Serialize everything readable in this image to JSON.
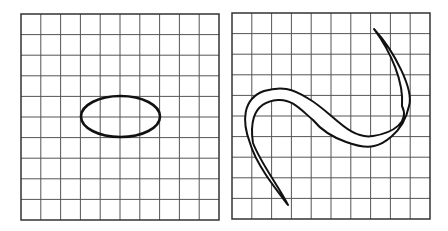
{
  "diagram": {
    "panels": [
      {
        "name": "ellipse-panel",
        "grid": {
          "x": 21,
          "y": 14,
          "width": 198,
          "height": 206,
          "cols": 10,
          "rows": 10
        },
        "shape": {
          "type": "ellipse",
          "cx": 120.5,
          "cy": 116.5,
          "rx": 39.5,
          "ry": 20.5
        }
      },
      {
        "name": "s-curve-panel",
        "grid": {
          "x": 232,
          "y": 13,
          "width": 198,
          "height": 206,
          "cols": 10,
          "rows": 10
        },
        "shape": {
          "type": "s-band",
          "path": "M374,29 C395,52 414,90 409,106 C403,135 380,145 374,146 C364,149 330,141 313,120 C300,109 292,99 278,100 C249,102 251,130 253,143 C261,164 280,188 288,205 C275,188 256,164 250,143 C242,122 242,99 264,91 C281,86 292,88 309,99 C333,113 349,140 373,136 C393,133 410,122 402,106 C404,82 391,52 374,29 Z"
        }
      }
    ],
    "colors": {
      "grid_line": "#555555",
      "stroke": "#111111",
      "background": "#ffffff"
    }
  }
}
